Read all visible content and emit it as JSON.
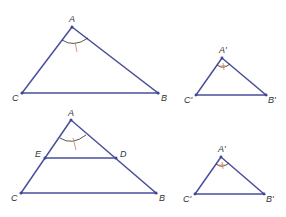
{
  "colors": {
    "edge": "#4a4f9a",
    "vertex": "#3f4590",
    "angle_arc": "#2b2b2b",
    "angle_tick": "#d4896a",
    "label": "#333333",
    "background": "#ffffff"
  },
  "figures": [
    {
      "name": "triangle-ABC-top",
      "labels": {
        "A": "A",
        "B": "B",
        "C": "C"
      }
    },
    {
      "name": "triangle-A'B'C'-top",
      "labels": {
        "A": "A'",
        "B": "B'",
        "C": "C'"
      }
    },
    {
      "name": "triangle-ABC-with-ED",
      "labels": {
        "A": "A",
        "B": "B",
        "C": "C",
        "D": "D",
        "E": "E"
      }
    },
    {
      "name": "triangle-A'B'C'-bottom",
      "labels": {
        "A": "A'",
        "B": "B'",
        "C": "C'"
      }
    }
  ]
}
